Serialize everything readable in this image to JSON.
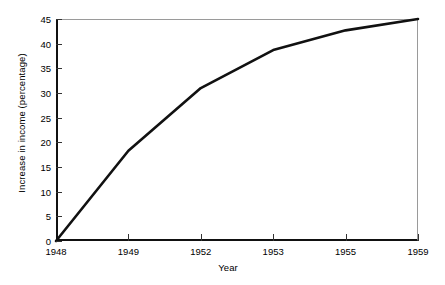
{
  "chart_data": {
    "type": "line",
    "title": "",
    "subtitle": "",
    "xlabel": "Year",
    "ylabel": "Increase in income (percentage)",
    "x": [
      "1948",
      "1949",
      "1952",
      "1953",
      "1955",
      "1959"
    ],
    "categories": [
      "1948",
      "1949",
      "1952",
      "1953",
      "1955",
      "1959"
    ],
    "values": [
      0,
      18.3,
      31,
      38.7,
      42.7,
      45
    ],
    "series": [
      {
        "name": "Increase in income",
        "values": [
          0,
          18.3,
          31,
          38.7,
          42.7,
          45
        ],
        "color": "#111111"
      }
    ],
    "ylim": [
      0,
      45
    ],
    "ytick_labels": [
      "0",
      "5",
      "10",
      "15",
      "20",
      "25",
      "30",
      "35",
      "40",
      "45"
    ],
    "ytick_values": [
      0,
      5,
      10,
      15,
      20,
      25,
      30,
      35,
      40,
      45
    ],
    "xtick_labels": [
      "1948",
      "1949",
      "1952",
      "1953",
      "1955",
      "1959"
    ],
    "grid": false,
    "legend": false,
    "legend_position": "none",
    "x_axis_spacing": "categorical-even",
    "annotations": [],
    "colors": {
      "line": "#111111",
      "axis": "#111111",
      "frame": "#9a9a9a",
      "background": "#ffffff",
      "text": "#000000"
    }
  }
}
